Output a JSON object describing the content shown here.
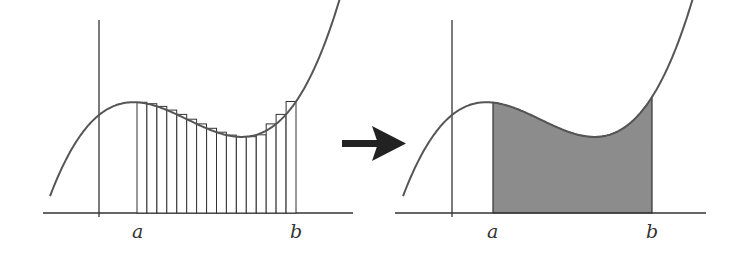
{
  "diagram": {
    "colors": {
      "curve": "#555555",
      "axis": "#333333",
      "rect_stroke": "#333333",
      "fill": "#8c8c8c",
      "arrow": "#222222"
    },
    "left_panel": {
      "title": "Riemann sum with rectangles",
      "label_a": "a",
      "label_b": "b",
      "rectangle_count": 16
    },
    "arrow": {
      "icon": "right-arrow-icon"
    },
    "right_panel": {
      "title": "Exact area under curve",
      "label_a": "a",
      "label_b": "b"
    }
  }
}
